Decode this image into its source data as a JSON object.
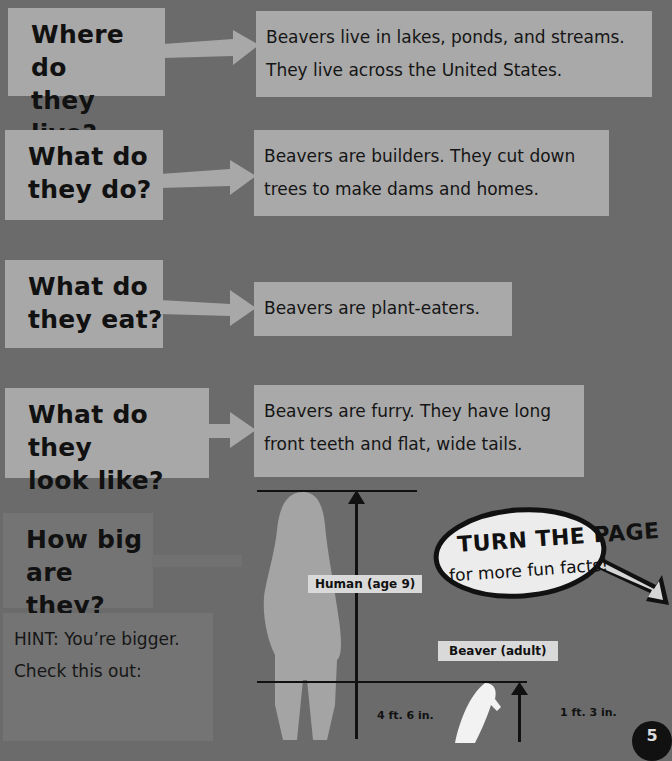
{
  "sections": [
    {
      "question_line1": "Where do",
      "question_line2": "they live?",
      "answer_line1": "Beavers live in lakes, ponds, and streams.",
      "answer_line2": "They live across the United States."
    },
    {
      "question_line1": "What do",
      "question_line2": "they do?",
      "answer_line1": "Beavers are builders. They cut down",
      "answer_line2": "trees to make dams and homes."
    },
    {
      "question_line1": "What do",
      "question_line2": "they eat?",
      "answer_line1": "Beavers are plant-eaters.",
      "answer_line2": ""
    },
    {
      "question_line1": "What do they",
      "question_line2": "look like?",
      "answer_line1": "Beavers are furry. They have long",
      "answer_line2": "front teeth and flat, wide tails."
    }
  ],
  "size_section": {
    "question_line1": "How big",
    "question_line2": "are they?",
    "hint_line1": "HINT: You’re bigger.",
    "hint_line2": "Check this out:"
  },
  "comparison": {
    "human_label": "Human (age 9)",
    "human_height": "4 ft. 6 in.",
    "beaver_label": "Beaver (adult)",
    "beaver_height": "1 ft. 3 in."
  },
  "callout": {
    "line1": "TURN THE PAGE",
    "line2": "for more fun facts!"
  },
  "page_number": "5",
  "colors": {
    "background": "#6b6b6b",
    "box": "#a9a9a9",
    "silhouette": "#a4a4a4"
  }
}
